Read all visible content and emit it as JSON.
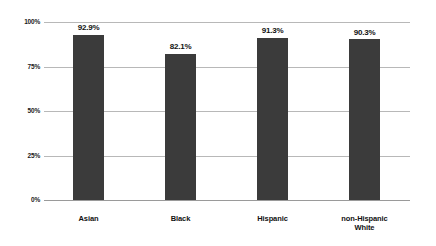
{
  "chart_data": {
    "type": "bar",
    "title": "",
    "subtitle": "",
    "xlabel": "",
    "ylabel": "",
    "categories": [
      "Asian",
      "Black",
      "Hispanic",
      "non-Hispanic\nWhite"
    ],
    "values": [
      92.9,
      82.1,
      91.3,
      90.3
    ],
    "value_labels": [
      "92.9%",
      "82.1%",
      "91.3%",
      "90.3%"
    ],
    "ylim": [
      0,
      100
    ],
    "yticks": [
      0,
      25,
      50,
      75,
      100
    ],
    "ytick_labels": [
      "0%",
      "25%",
      "50%",
      "75%",
      "100%"
    ],
    "grid": true,
    "grid_axis": "y",
    "legend": false,
    "legend_position": "none",
    "orientation": "vertical",
    "series": [
      {
        "name": "",
        "values": [
          92.9,
          82.1,
          91.3,
          90.3
        ]
      }
    ]
  },
  "style": {
    "bar_color": "#3b3b3b",
    "grid_color": "#b8b8b8",
    "baseline_color": "#9a9a9a",
    "text_color": "#111111",
    "background": "#ffffff"
  }
}
